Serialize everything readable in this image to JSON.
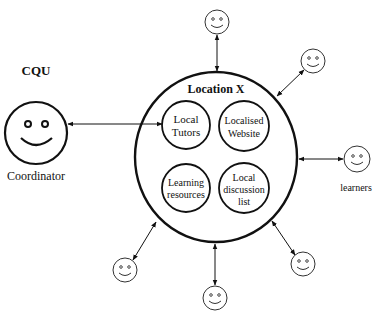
{
  "diagram": {
    "coordinator": {
      "org_label": "CQU",
      "role_label": "Coordinator"
    },
    "location": {
      "title": "Location X",
      "components": [
        {
          "id": "local-tutors",
          "lines": [
            "Local",
            "Tutors"
          ]
        },
        {
          "id": "localised-website",
          "lines": [
            "Localised",
            "Website"
          ]
        },
        {
          "id": "learning-resources",
          "lines": [
            "Learning",
            "resources"
          ]
        },
        {
          "id": "local-discussion-list",
          "lines": [
            "Local",
            "discussion",
            "list"
          ]
        }
      ]
    },
    "learners": {
      "label": "learners",
      "count": 6
    },
    "colors": {
      "stroke": "#111111",
      "background": "#ffffff"
    }
  }
}
